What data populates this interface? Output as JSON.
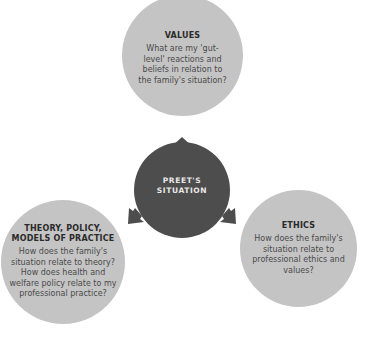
{
  "diagram": {
    "center": {
      "label_line1": "PREET'S",
      "label_line2": "SITUATION",
      "color": "#4d4d4d"
    },
    "nodes": [
      {
        "id": "values",
        "title": "VALUES",
        "body": "What are my 'gut-level' reactions and beliefs in relation to the family's situation?"
      },
      {
        "id": "theory",
        "title": "THEORY, POLICY, MODELS OF PRACTICE",
        "body": "How does the family's situation relate to theory? How does health and welfare policy relate to my professional practice?"
      },
      {
        "id": "ethics",
        "title": "ETHICS",
        "body": "How does the family's situation relate to professional ethics and values?"
      }
    ],
    "node_color": "#c4c4c4"
  }
}
